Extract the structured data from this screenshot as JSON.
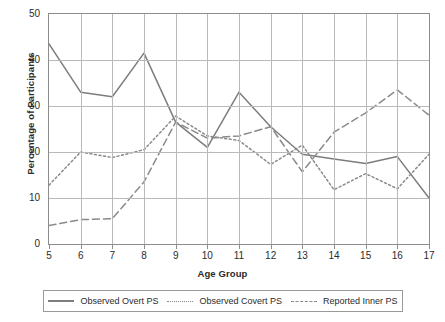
{
  "chart_data": {
    "type": "line",
    "title": "",
    "xlabel": "Age Group",
    "ylabel": "Percentage of Participants",
    "x": [
      5,
      6,
      7,
      8,
      9,
      10,
      11,
      12,
      13,
      14,
      15,
      16,
      17
    ],
    "categories": [
      "5",
      "6",
      "7",
      "8",
      "9",
      "10",
      "11",
      "12",
      "13",
      "14",
      "15",
      "16",
      "17"
    ],
    "xlim": [
      5,
      17
    ],
    "ylim": [
      0,
      50
    ],
    "yticks": [
      0,
      10,
      20,
      30,
      40,
      50
    ],
    "ytick_labels": [
      "0",
      "10",
      "20",
      "30",
      "40",
      "50"
    ],
    "grid": true,
    "legend_position": "bottom",
    "series": [
      {
        "name": "Observed Overt PS",
        "style": "solid",
        "color": "#7d7d7d",
        "values": [
          43.5,
          33.0,
          32.0,
          41.5,
          26.5,
          21.0,
          33.0,
          25.5,
          19.5,
          18.5,
          17.5,
          19.0,
          10.0
        ]
      },
      {
        "name": "Observed Covert PS",
        "style": "dotted",
        "color": "#8a8a8a",
        "values": [
          12.8,
          20.0,
          18.8,
          20.5,
          27.8,
          23.5,
          22.5,
          17.3,
          21.5,
          11.8,
          15.3,
          12.0,
          19.5
        ]
      },
      {
        "name": "Reported Inner PS",
        "style": "dashed",
        "color": "#8a8a8a",
        "values": [
          4.0,
          5.3,
          5.5,
          13.5,
          26.5,
          23.0,
          23.5,
          25.5,
          15.7,
          24.3,
          28.5,
          33.5,
          28.0
        ]
      }
    ]
  },
  "axes": {
    "y_title": "Percentage of Participants",
    "x_title": "Age Group",
    "y_labels": [
      "50",
      "40",
      "30",
      "20",
      "10",
      "0"
    ],
    "x_labels": [
      "5",
      "6",
      "7",
      "8",
      "9",
      "10",
      "11",
      "12",
      "13",
      "14",
      "15",
      "16",
      "17"
    ]
  },
  "legend": {
    "items": [
      {
        "label": "Observed Overt PS",
        "style": "solid"
      },
      {
        "label": "Observed Covert PS",
        "style": "dotted"
      },
      {
        "label": "Reported Inner PS",
        "style": "dashed"
      }
    ]
  }
}
